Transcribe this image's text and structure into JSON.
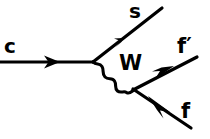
{
  "diagram": {
    "background_color": "#ffffff",
    "stroke_color": "#000000",
    "labels": {
      "incoming_quark": "c",
      "outgoing_quark": "s",
      "boson": "W",
      "fermion_primed": "f′",
      "fermion": "f"
    },
    "lines": [
      {
        "name": "c-quark-line",
        "type": "fermion-straight",
        "from": [
          0,
          62
        ],
        "to": [
          93,
          62
        ],
        "arrow_at": [
          52,
          62
        ],
        "label": "c"
      },
      {
        "name": "s-quark-line",
        "type": "fermion-straight",
        "from": [
          93,
          62
        ],
        "to": [
          162,
          8
        ],
        "arrow_at": [
          126,
          40
        ],
        "label": "s"
      },
      {
        "name": "w-boson-propagator",
        "type": "boson-wavy",
        "from": [
          93,
          62
        ],
        "to": [
          134,
          90
        ],
        "waves": 3,
        "label": "W"
      },
      {
        "name": "f-prime-line",
        "type": "fermion-straight",
        "from": [
          134,
          90
        ],
        "to": [
          197,
          57
        ],
        "arrow_at": [
          168,
          74
        ],
        "label": "f′"
      },
      {
        "name": "f-line",
        "type": "fermion-straight",
        "from": [
          134,
          90
        ],
        "to": [
          191,
          128
        ],
        "arrow_at": [
          165,
          110
        ],
        "label": "f"
      }
    ],
    "vertices": [
      {
        "name": "vertex-c-s-w",
        "position": [
          93,
          62
        ]
      },
      {
        "name": "vertex-w-f-fprime",
        "position": [
          134,
          90
        ]
      }
    ]
  }
}
